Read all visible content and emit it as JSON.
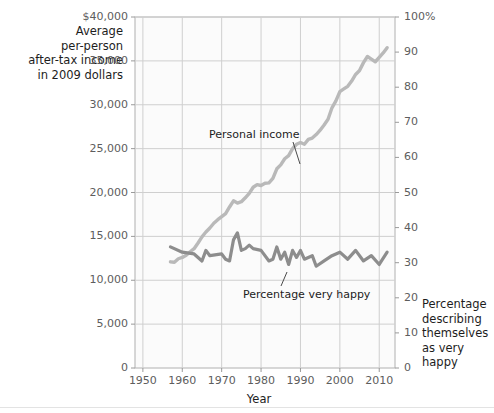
{
  "chart_data": {
    "type": "line",
    "title": "",
    "xlabel": "Year",
    "ylabel": "Average\nper-person\nafter-tax income\nin 2009 dollars",
    "ylabel_right": "Percentage\ndescribing\nthemselves\nas very happy",
    "xlim": [
      1948,
      2014
    ],
    "ylim": [
      0,
      40000
    ],
    "ylim_right": [
      0,
      100
    ],
    "grid": true,
    "legend_position": "inline-annotations",
    "xticks": [
      "1950",
      "1960",
      "1970",
      "1980",
      "1990",
      "2000",
      "2010"
    ],
    "xtick_values": [
      1950,
      1960,
      1970,
      1980,
      1990,
      2000,
      2010
    ],
    "yticks_left": [
      "$40,000",
      "35,000",
      "30,000",
      "25,000",
      "20,000",
      "15,000",
      "10,000",
      "5,000",
      "0"
    ],
    "ytick_values_left": [
      40000,
      35000,
      30000,
      25000,
      20000,
      15000,
      10000,
      5000,
      0
    ],
    "yticks_right": [
      "100%",
      "90",
      "80",
      "70",
      "60",
      "50",
      "40",
      "30",
      "20",
      "10",
      "0"
    ],
    "ytick_values_right": [
      100,
      90,
      80,
      70,
      60,
      50,
      40,
      30,
      20,
      10,
      0
    ],
    "annotations": [
      {
        "text": "Personal income",
        "x": 1978,
        "y": 29200
      },
      {
        "text": "Percentage very happy",
        "x": 1983,
        "y": 8600
      }
    ],
    "series": [
      {
        "name": "Personal income",
        "axis": "left",
        "color": "#b9b9b9",
        "units": "2009 dollars",
        "x": [
          1957,
          1958,
          1959,
          1960,
          1961,
          1962,
          1963,
          1964,
          1965,
          1966,
          1967,
          1968,
          1969,
          1970,
          1971,
          1972,
          1973,
          1974,
          1975,
          1976,
          1977,
          1978,
          1979,
          1980,
          1981,
          1982,
          1983,
          1984,
          1985,
          1986,
          1987,
          1988,
          1989,
          1990,
          1991,
          1992,
          1993,
          1994,
          1995,
          1996,
          1997,
          1998,
          1999,
          2000,
          2001,
          2002,
          2003,
          2004,
          2005,
          2006,
          2007,
          2008,
          2009,
          2010,
          2011,
          2012
        ],
        "values": [
          12100,
          12050,
          12450,
          12600,
          12850,
          13250,
          13600,
          14250,
          14950,
          15500,
          15950,
          16500,
          16900,
          17250,
          17600,
          18350,
          19050,
          18800,
          18950,
          19400,
          19900,
          20600,
          20900,
          20800,
          21050,
          21100,
          21600,
          22700,
          23150,
          23850,
          24200,
          25000,
          25500,
          25700,
          25500,
          26050,
          26200,
          26600,
          27100,
          27700,
          28350,
          29650,
          30450,
          31500,
          31800,
          32100,
          32700,
          33450,
          33900,
          34800,
          35500,
          35200,
          34900,
          35400,
          35900,
          36500
        ]
      },
      {
        "name": "Percentage very happy",
        "axis": "right",
        "color": "#8d8d8d",
        "units": "percent",
        "x": [
          1957,
          1960,
          1963,
          1965,
          1966,
          1967,
          1970,
          1971,
          1972,
          1973,
          1974,
          1975,
          1976,
          1977,
          1978,
          1980,
          1982,
          1983,
          1984,
          1985,
          1986,
          1987,
          1988,
          1989,
          1990,
          1991,
          1993,
          1994,
          1996,
          1998,
          2000,
          2002,
          2004,
          2006,
          2008,
          2010,
          2012
        ],
        "values": [
          34.5,
          33.0,
          32.5,
          30.5,
          33.5,
          32.0,
          32.5,
          31.0,
          30.5,
          36.5,
          38.5,
          33.5,
          34.0,
          35.0,
          34.0,
          33.5,
          30.5,
          31.0,
          34.5,
          31.0,
          33.0,
          29.5,
          33.5,
          31.5,
          33.5,
          31.0,
          32.0,
          29.0,
          30.5,
          32.0,
          33.0,
          31.0,
          33.5,
          30.5,
          32.0,
          29.5,
          33.0
        ]
      }
    ]
  },
  "axis_titles": {
    "left": "Average\nper-person\nafter-tax income\nin 2009 dollars",
    "right": "Percentage\ndescribing\nthemselves\nas very happy",
    "bottom": "Year"
  }
}
